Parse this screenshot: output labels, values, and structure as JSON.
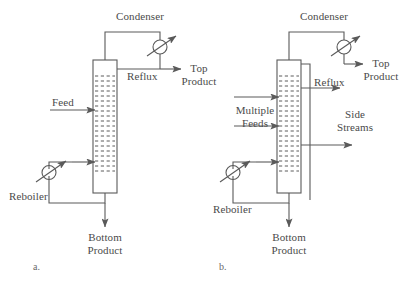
{
  "figure": {
    "background_color": "#ffffff",
    "line_color": "#5a5a5a",
    "text_color": "#4a4a4a"
  },
  "diagram_a": {
    "caption": "a.",
    "labels": {
      "condenser": "Condenser",
      "reflux": "Reflux",
      "top_product_line1": "Top",
      "top_product_line2": "Product",
      "feed": "Feed",
      "reboiler": "Reboiler",
      "bottom_product_line1": "Bottom",
      "bottom_product_line2": "Product"
    }
  },
  "diagram_b": {
    "caption": "b.",
    "labels": {
      "condenser": "Condenser",
      "reflux": "Reflux",
      "top_product_line1": "Top",
      "top_product_line2": "Product",
      "multiple_feeds_line1": "Multiple",
      "multiple_feeds_line2": "Feeds",
      "side_streams_line1": "Side",
      "side_streams_line2": "Streams",
      "reboiler": "Reboiler",
      "bottom_product_line1": "Bottom",
      "bottom_product_line2": "Product"
    }
  }
}
